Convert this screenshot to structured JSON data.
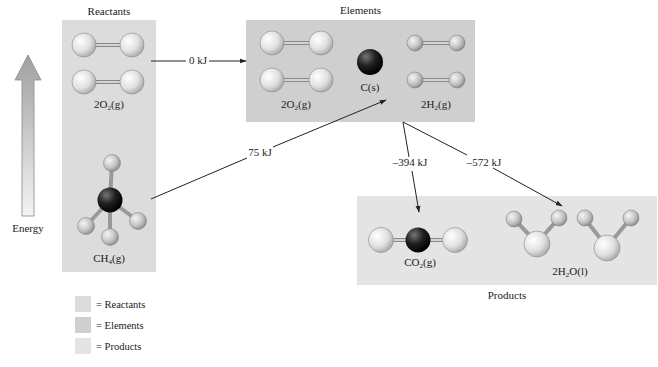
{
  "diagram": {
    "type": "energy-level diagram (Hess's law, combustion of methane)",
    "colors": {
      "reactants": "#dcdcdc",
      "elements": "#cfcfcf",
      "products": "#e4e4e4",
      "arrow": "#222222"
    },
    "energy_axis": {
      "label": "Energy"
    },
    "reactants": {
      "title": "Reactants",
      "o2_label": "2O",
      "o2_sub": "2",
      "o2_state": "(g)",
      "ch4_label": "CH",
      "ch4_sub": "4",
      "ch4_state": "(g)"
    },
    "elements": {
      "title": "Elements",
      "o2_label": "2O",
      "o2_sub": "2",
      "o2_state": "(g)",
      "c_label": "C(s)",
      "h2_label": "2H",
      "h2_sub": "2",
      "h2_state": "(g)"
    },
    "products": {
      "title": "Products",
      "co2_label": "CO",
      "co2_sub": "2",
      "co2_state": "(g)",
      "h2o_label": "2H",
      "h2o_sub": "2",
      "h2o_state": "O(l)"
    },
    "arrows": [
      {
        "id": "o2-to-elements",
        "label": "0 kJ"
      },
      {
        "id": "ch4-to-elements",
        "label": "75 kJ"
      },
      {
        "id": "elements-to-co2",
        "label": "–394 kJ"
      },
      {
        "id": "elements-to-h2o",
        "label": "–572 kJ"
      }
    ],
    "legend": [
      {
        "label": "= Reactants"
      },
      {
        "label": "= Elements"
      },
      {
        "label": "= Products"
      }
    ]
  }
}
